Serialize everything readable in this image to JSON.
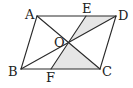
{
  "diagram": {
    "colors": {
      "stroke": "#2a2a2a",
      "shade": "#e6e6e6",
      "label": "#222222"
    },
    "points": {
      "A": {
        "x": 37,
        "y": 16
      },
      "D": {
        "x": 116,
        "y": 16
      },
      "B": {
        "x": 21,
        "y": 69
      },
      "C": {
        "x": 100,
        "y": 69
      },
      "O": {
        "x": 68.5,
        "y": 42.5
      },
      "E": {
        "x": 86,
        "y": 16
      },
      "F": {
        "x": 51,
        "y": 69
      }
    },
    "labels": [
      {
        "text": "A",
        "x": 25,
        "y": 19
      },
      {
        "text": "E",
        "x": 82,
        "y": 13
      },
      {
        "text": "D",
        "x": 118,
        "y": 20
      },
      {
        "text": "O",
        "x": 54,
        "y": 47
      },
      {
        "text": "B",
        "x": 8,
        "y": 76
      },
      {
        "text": "F",
        "x": 46,
        "y": 82
      },
      {
        "text": "C",
        "x": 102,
        "y": 76
      }
    ],
    "shaded_regions": [
      {
        "name": "triangle-OED",
        "points": "68.5,42.5 86,16 116,16"
      },
      {
        "name": "triangle-OFC",
        "points": "68.5,42.5 51,69 100,69"
      }
    ],
    "segments": [
      {
        "name": "side-AD",
        "from": "A",
        "to": "D"
      },
      {
        "name": "side-DC",
        "from": "D",
        "to": "C"
      },
      {
        "name": "side-CB",
        "from": "C",
        "to": "B"
      },
      {
        "name": "side-BA",
        "from": "B",
        "to": "A"
      },
      {
        "name": "diagonal-AC",
        "from": "A",
        "to": "C"
      },
      {
        "name": "diagonal-BD",
        "from": "B",
        "to": "D"
      },
      {
        "name": "segment-EF",
        "from": "E",
        "to": "F"
      }
    ]
  }
}
